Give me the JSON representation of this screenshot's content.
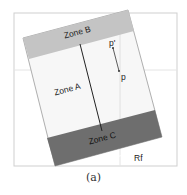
{
  "figure": {
    "caption": "(a)",
    "zones": {
      "zone_b": "Zone B",
      "zone_a": "Zone A",
      "zone_c": "Zone C"
    },
    "points": {
      "p_prime": "p'",
      "p": "p"
    },
    "axis_label": "Rf",
    "colors": {
      "zone_b": "#c4c4c4",
      "zone_a": "#f7f7f7",
      "zone_c": "#6e6e6e",
      "frame": "#cfcfcf",
      "grid": "#e4e4e4"
    }
  }
}
